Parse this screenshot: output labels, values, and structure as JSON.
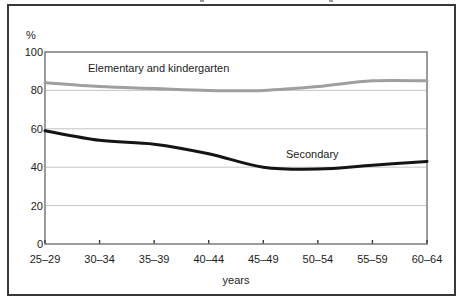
{
  "chart_data": {
    "type": "line",
    "title": "",
    "categories": [
      "25–29",
      "30–34",
      "35–39",
      "40–44",
      "45–49",
      "50–54",
      "55–59",
      "60–64"
    ],
    "series": [
      {
        "name": "Elementary and kindergarten",
        "color": "#9f9f9f",
        "values": [
          84,
          82,
          81,
          80,
          80,
          82,
          85,
          85
        ]
      },
      {
        "name": "Secondary",
        "color": "#141414",
        "values": [
          59,
          54,
          52,
          47,
          40,
          39,
          41,
          43
        ]
      }
    ],
    "xlabel": "years",
    "ylabel": "%",
    "ylim": [
      0,
      100
    ],
    "y_ticks": [
      100,
      80,
      60,
      40,
      20,
      0
    ],
    "grid": true,
    "legend": "inline-annotations",
    "colors": {
      "outer_border": "#383838",
      "plot_border": "#828282",
      "gridline": "#c4c4c4",
      "tick_mark": "#3a3a3a",
      "text": "#1c1c1c"
    }
  }
}
